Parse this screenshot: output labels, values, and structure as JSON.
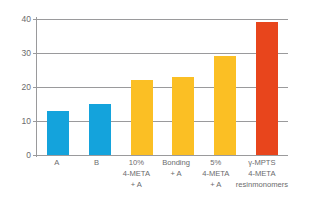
{
  "chart_data": {
    "type": "bar",
    "title": "",
    "subtitle": "",
    "xlabel": "",
    "ylabel": "",
    "ylim": [
      0,
      40
    ],
    "yticks": [
      0,
      10,
      20,
      30,
      40
    ],
    "ytick_labels": [
      "0",
      "10",
      "20",
      "30",
      "40"
    ],
    "grid": true,
    "legend": false,
    "legend_position": "none",
    "categories": [
      "A",
      "B",
      "10% 4-META + A",
      "Bonding + A",
      "5% 4-META + A",
      "γ-MPTS 4-META resinmonomers"
    ],
    "category_lines": [
      [
        "A"
      ],
      [
        "B"
      ],
      [
        "10%",
        "4-META",
        "+ A"
      ],
      [
        "Bonding",
        "+ A"
      ],
      [
        "5%",
        "4-META",
        "+ A"
      ],
      [
        "γ-MPTS",
        "4-META",
        "resinmonomers"
      ]
    ],
    "values": [
      13,
      15,
      22,
      23,
      29,
      39
    ],
    "bar_colors": [
      "#14a3dc",
      "#14a3dc",
      "#fbbf24",
      "#fbbf24",
      "#fbbf24",
      "#e8451c"
    ]
  },
  "colors": {
    "blue": "#14a3dc",
    "yellow": "#fbbf24",
    "red": "#e8451c",
    "axis": "#9a9a9c",
    "text": "#6b6b6d",
    "background": "#ffffff"
  }
}
